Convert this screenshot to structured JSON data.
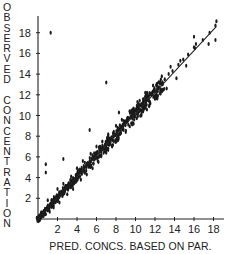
{
  "chart_data": {
    "type": "scatter",
    "title": "",
    "xlabel": "PRED. CONCS. BASED ON PAR.",
    "ylabel": "OBSERVED CONCENTRATION",
    "x_ticks": [
      2,
      4,
      6,
      8,
      10,
      12,
      14,
      16,
      18
    ],
    "y_ticks": [
      2,
      4,
      6,
      8,
      10,
      12,
      14,
      16,
      18
    ],
    "xlim": [
      0,
      19
    ],
    "ylim": [
      0,
      19
    ],
    "grid": false,
    "legend": null,
    "fit_line": {
      "from": [
        0,
        0
      ],
      "to": [
        18.3,
        18.6
      ]
    },
    "series": [
      {
        "name": "observations",
        "points": [
          [
            0.3,
            0.3
          ],
          [
            0.5,
            0.6
          ],
          [
            0.7,
            0.8
          ],
          [
            0.9,
            1.0
          ],
          [
            1.1,
            1.2
          ],
          [
            1.3,
            1.3
          ],
          [
            1.5,
            1.6
          ],
          [
            1.7,
            1.9
          ],
          [
            1.9,
            2.0
          ],
          [
            2.1,
            2.2
          ],
          [
            2.3,
            2.5
          ],
          [
            2.5,
            2.6
          ],
          [
            2.7,
            2.9
          ],
          [
            2.9,
            3.0
          ],
          [
            3.1,
            3.3
          ],
          [
            3.3,
            3.4
          ],
          [
            3.5,
            3.7
          ],
          [
            3.7,
            3.9
          ],
          [
            3.9,
            4.0
          ],
          [
            4.1,
            4.3
          ],
          [
            4.3,
            4.5
          ],
          [
            4.5,
            4.7
          ],
          [
            4.7,
            4.9
          ],
          [
            4.9,
            5.1
          ],
          [
            5.1,
            5.3
          ],
          [
            5.3,
            5.5
          ],
          [
            5.5,
            5.8
          ],
          [
            5.7,
            5.9
          ],
          [
            5.9,
            6.1
          ],
          [
            6.1,
            6.4
          ],
          [
            6.3,
            6.5
          ],
          [
            6.5,
            6.8
          ],
          [
            6.7,
            6.9
          ],
          [
            6.9,
            7.2
          ],
          [
            7.1,
            7.4
          ],
          [
            7.3,
            7.6
          ],
          [
            7.5,
            7.8
          ],
          [
            7.7,
            8.0
          ],
          [
            7.9,
            8.2
          ],
          [
            8.1,
            8.4
          ],
          [
            8.3,
            8.6
          ],
          [
            8.5,
            8.9
          ],
          [
            8.7,
            9.0
          ],
          [
            8.9,
            9.3
          ],
          [
            9.1,
            9.5
          ],
          [
            9.3,
            9.7
          ],
          [
            9.5,
            9.9
          ],
          [
            9.7,
            10.1
          ],
          [
            9.9,
            10.3
          ],
          [
            10.1,
            10.5
          ],
          [
            10.3,
            10.7
          ],
          [
            10.5,
            11.0
          ],
          [
            10.7,
            11.1
          ],
          [
            10.9,
            11.4
          ],
          [
            11.1,
            11.5
          ],
          [
            11.3,
            11.8
          ],
          [
            11.6,
            12.0
          ],
          [
            11.9,
            12.4
          ],
          [
            12.3,
            12.7
          ],
          [
            12.6,
            13.1
          ],
          [
            13.0,
            13.5
          ],
          [
            13.4,
            14.0
          ],
          [
            13.8,
            14.3
          ],
          [
            14.4,
            14.9
          ],
          [
            14.9,
            15.4
          ],
          [
            15.4,
            15.9
          ],
          [
            16.1,
            16.5
          ],
          [
            16.9,
            17.3
          ],
          [
            17.6,
            18.0
          ],
          [
            18.2,
            18.7
          ],
          [
            1.0,
            1.8
          ],
          [
            1.2,
            0.7
          ],
          [
            1.6,
            1.1
          ],
          [
            2.0,
            2.9
          ],
          [
            2.2,
            1.6
          ],
          [
            2.6,
            3.4
          ],
          [
            3.0,
            2.4
          ],
          [
            3.4,
            4.1
          ],
          [
            3.6,
            2.9
          ],
          [
            4.0,
            4.9
          ],
          [
            4.4,
            3.8
          ],
          [
            4.6,
            5.6
          ],
          [
            5.0,
            4.3
          ],
          [
            5.4,
            6.3
          ],
          [
            5.6,
            4.9
          ],
          [
            6.0,
            7.0
          ],
          [
            6.2,
            5.5
          ],
          [
            6.6,
            7.5
          ],
          [
            7.0,
            6.4
          ],
          [
            7.2,
            8.2
          ],
          [
            7.6,
            7.0
          ],
          [
            8.0,
            9.0
          ],
          [
            8.2,
            7.6
          ],
          [
            8.6,
            9.6
          ],
          [
            9.0,
            8.4
          ],
          [
            9.4,
            10.4
          ],
          [
            9.8,
            9.2
          ],
          [
            10.2,
            11.3
          ],
          [
            10.6,
            10.0
          ],
          [
            11.0,
            12.2
          ],
          [
            11.4,
            10.9
          ],
          [
            11.8,
            12.9
          ],
          [
            12.2,
            11.7
          ],
          [
            12.7,
            13.8
          ],
          [
            13.2,
            12.6
          ],
          [
            13.6,
            14.7
          ],
          [
            14.2,
            13.6
          ],
          [
            14.6,
            15.3
          ],
          [
            15.2,
            14.8
          ],
          [
            16.2,
            16.9
          ],
          [
            0.8,
            4.5
          ],
          [
            0.8,
            5.3
          ],
          [
            1.3,
            18.0
          ],
          [
            2.6,
            5.8
          ],
          [
            5.3,
            8.6
          ],
          [
            7.0,
            13.2
          ],
          [
            8.3,
            10.3
          ],
          [
            16.0,
            16.6
          ],
          [
            16.0,
            17.6
          ],
          [
            17.5,
            16.9
          ],
          [
            18.3,
            19.1
          ],
          [
            18.2,
            17.3
          ]
        ]
      }
    ]
  },
  "axes": {
    "ylabel_letters": [
      "O",
      "B",
      "S",
      "E",
      "R",
      "V",
      "E",
      "D",
      "",
      "C",
      "O",
      "N",
      "C",
      "E",
      "N",
      "T",
      "R",
      "A",
      "T",
      "I",
      "O",
      "N"
    ],
    "xlabel": "PRED. CONCS. BASED ON PAR.",
    "x_tick_labels": [
      "2",
      "4",
      "6",
      "8",
      "10",
      "12",
      "14",
      "16",
      "18"
    ],
    "y_tick_labels": [
      "2",
      "4",
      "6",
      "8",
      "10",
      "12",
      "14",
      "16",
      "18"
    ]
  }
}
